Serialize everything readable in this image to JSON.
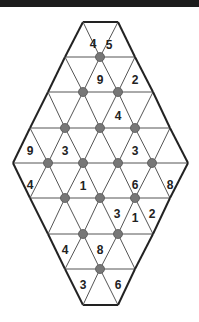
{
  "puzzle": {
    "type": "triangular-grid number puzzle",
    "colors": {
      "grid_line": "#555555",
      "border": "#222222",
      "dot": "#777777",
      "text": "#222222"
    },
    "rows_y": [
      22,
      57,
      92,
      128,
      163,
      198,
      234,
      269,
      305
    ],
    "row_edges": [
      [
        83,
        118
      ],
      [
        65,
        135
      ],
      [
        48,
        153
      ],
      [
        30,
        170
      ],
      [
        13,
        188
      ],
      [
        30,
        170
      ],
      [
        48,
        153
      ],
      [
        65,
        135
      ],
      [
        83,
        118
      ]
    ],
    "dots": [
      [
        100,
        57
      ],
      [
        83,
        92
      ],
      [
        118,
        92
      ],
      [
        65,
        128
      ],
      [
        100,
        128
      ],
      [
        135,
        128
      ],
      [
        48,
        163
      ],
      [
        83,
        163
      ],
      [
        118,
        163
      ],
      [
        152,
        163
      ],
      [
        65,
        198
      ],
      [
        100,
        198
      ],
      [
        135,
        198
      ],
      [
        83,
        234
      ],
      [
        118,
        234
      ],
      [
        100,
        269
      ]
    ],
    "clues": [
      {
        "v": "4",
        "x": 93,
        "y": 44
      },
      {
        "v": "5",
        "x": 109,
        "y": 45
      },
      {
        "v": "9",
        "x": 100,
        "y": 80
      },
      {
        "v": "2",
        "x": 135,
        "y": 80
      },
      {
        "v": "4",
        "x": 118,
        "y": 116
      },
      {
        "v": "9",
        "x": 30,
        "y": 151
      },
      {
        "v": "3",
        "x": 65,
        "y": 151
      },
      {
        "v": "3",
        "x": 135,
        "y": 151
      },
      {
        "v": "4",
        "x": 30,
        "y": 185
      },
      {
        "v": "1",
        "x": 83,
        "y": 186
      },
      {
        "v": "6",
        "x": 135,
        "y": 185
      },
      {
        "v": "8",
        "x": 170,
        "y": 185
      },
      {
        "v": "3",
        "x": 117,
        "y": 214
      },
      {
        "v": "1",
        "x": 135,
        "y": 218
      },
      {
        "v": "2",
        "x": 152,
        "y": 214
      },
      {
        "v": "4",
        "x": 65,
        "y": 250
      },
      {
        "v": "8",
        "x": 100,
        "y": 250
      },
      {
        "v": "3",
        "x": 83,
        "y": 285
      },
      {
        "v": "6",
        "x": 118,
        "y": 285
      }
    ]
  }
}
